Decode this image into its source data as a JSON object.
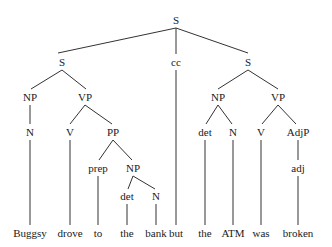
{
  "figure": {
    "sentence": "Buggsy drove to the bank but the ATM was broken",
    "background_color": "#ffffff",
    "line_color": "#333333",
    "text_color": "#1a1a1a"
  },
  "nodes": {
    "root_s": "S",
    "left_s": "S",
    "cc": "cc",
    "right_s": "S",
    "left_np": "NP",
    "left_vp": "VP",
    "right_np": "NP",
    "right_vp": "VP",
    "left_n": "N",
    "left_v": "V",
    "pp": "PP",
    "right_det": "det",
    "right_n": "N",
    "right_v": "V",
    "adjp": "AdjP",
    "prep": "prep",
    "pp_np": "NP",
    "adj": "adj",
    "pp_det": "det",
    "pp_n": "N"
  },
  "leaves": {
    "buggsy": "Buggsy",
    "drove": "drove",
    "to": "to",
    "the1": "the",
    "bank": "bank",
    "but": "but",
    "the2": "the",
    "atm": "ATM",
    "was": "was",
    "broken": "broken"
  }
}
